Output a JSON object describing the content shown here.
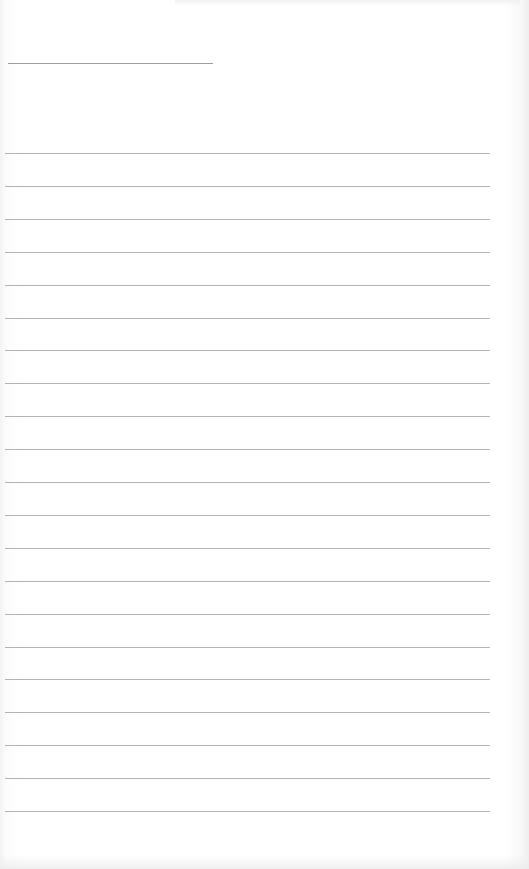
{
  "document": {
    "type": "blank lined writing sheet",
    "header_rule": {
      "x": 8,
      "y": 63,
      "width": 205
    },
    "writing_lines": {
      "count": 21,
      "first_y": 153,
      "spacing": 32.9,
      "x_start": 5,
      "x_end": 490,
      "color": "#b4b4b4"
    },
    "text": []
  }
}
